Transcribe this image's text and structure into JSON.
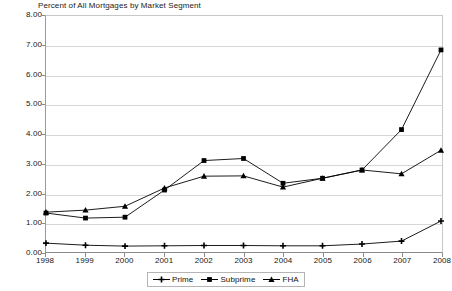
{
  "chart_data": {
    "type": "line",
    "title": "Percent of All Mortgages by Market Segment",
    "xlabel": "",
    "ylabel": "",
    "categories": [
      "1998",
      "1999",
      "2000",
      "2001",
      "2002",
      "2003",
      "2004",
      "2005",
      "2006",
      "2007",
      "2008"
    ],
    "x": [
      1998,
      1999,
      2000,
      2001,
      2002,
      2003,
      2004,
      2005,
      2006,
      2007,
      2008
    ],
    "series": [
      {
        "name": "Prime",
        "marker": "plus",
        "color": "#000000",
        "values": [
          0.3,
          0.23,
          0.2,
          0.21,
          0.22,
          0.22,
          0.21,
          0.21,
          0.27,
          0.37,
          1.05
        ]
      },
      {
        "name": "Subprime",
        "marker": "square",
        "color": "#000000",
        "values": [
          1.32,
          1.15,
          1.18,
          2.1,
          3.1,
          3.17,
          2.33,
          2.5,
          2.78,
          4.15,
          6.85
        ]
      },
      {
        "name": "FHA",
        "marker": "triangle",
        "color": "#000000",
        "values": [
          1.35,
          1.42,
          1.55,
          2.17,
          2.57,
          2.58,
          2.2,
          2.5,
          2.78,
          2.65,
          3.45
        ]
      }
    ],
    "ylim": [
      0.0,
      8.0
    ],
    "ytick_step": 1.0,
    "ytick_labels": [
      "0.00",
      "1.00",
      "2.00",
      "3.00",
      "4.00",
      "5.00",
      "6.00",
      "7.00",
      "8.00"
    ],
    "grid": true,
    "grid_axis": "y",
    "legend_position": "bottom-center",
    "legend_entries": [
      "Prime",
      "Subprime",
      "FHA"
    ]
  }
}
